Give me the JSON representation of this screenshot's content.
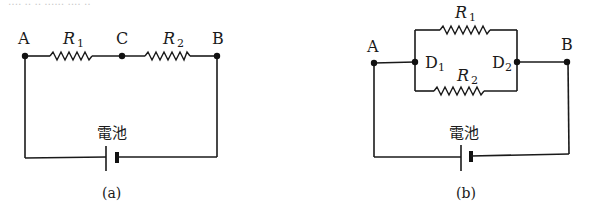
{
  "top_fragment": "‥‥ ‥ ‥ ‥‥‥ ‥‥ ‥",
  "diagram_a": {
    "caption": "(a)",
    "nodes": {
      "A": "A",
      "C": "C",
      "B": "B"
    },
    "resistors": {
      "r1": {
        "letter": "R",
        "sub": "1"
      },
      "r2": {
        "letter": "R",
        "sub": "2"
      }
    },
    "battery_label": "電池"
  },
  "diagram_b": {
    "caption": "(b)",
    "nodes": {
      "A": "A",
      "B": "B",
      "D1": "D",
      "D1_sub": "1",
      "D2": "D",
      "D2_sub": "2"
    },
    "resistors": {
      "r1": {
        "letter": "R",
        "sub": "1"
      },
      "r2": {
        "letter": "R",
        "sub": "2"
      }
    },
    "battery_label": "電池"
  },
  "colors": {
    "line": "#1a1a1a",
    "background": "#ffffff"
  }
}
